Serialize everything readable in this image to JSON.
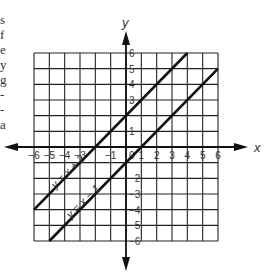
{
  "text_fragments": [
    "s",
    "f",
    "e",
    "y",
    "g",
    "-",
    "-",
    "a"
  ],
  "chart_data": {
    "type": "line",
    "title": "",
    "xlabel": "x",
    "ylabel": "y",
    "xlim": [
      -6,
      6
    ],
    "ylim": [
      -6,
      6
    ],
    "grid": true,
    "x_tick_labels": [
      "-6",
      "-5",
      "-4",
      "-3",
      "-1",
      "1",
      "2",
      "3",
      "4",
      "5",
      "6"
    ],
    "y_tick_labels": [
      "6",
      "5",
      "4",
      "3",
      "1",
      "-2",
      "-3",
      "-4",
      "-5",
      "-6"
    ],
    "origin_label": "0",
    "series": [
      {
        "name": "y = x + 2",
        "label": "y = x + 2",
        "x": [
          -6,
          4
        ],
        "y": [
          -4,
          6
        ]
      },
      {
        "name": "y = x − 1",
        "label": "y = x − 1",
        "x": [
          -5,
          6
        ],
        "y": [
          -6,
          5
        ]
      }
    ]
  },
  "colors": {
    "grid": "#222222",
    "line": "#111111",
    "text": "#333333"
  }
}
